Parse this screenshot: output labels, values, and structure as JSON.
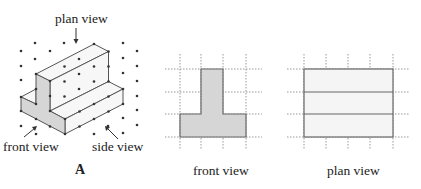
{
  "figure": {
    "isometric": {
      "caption": "A",
      "labels": {
        "plan_view": "plan view",
        "front_view": "front view",
        "side_view": "side view"
      },
      "lattice": {
        "origin": [
          65,
          134
        ],
        "u": [
          14.5,
          -7.5
        ],
        "v": [
          -14.5,
          -7.5
        ],
        "w": [
          0,
          -15
        ]
      },
      "colors": {
        "line": "#555555",
        "shade": "#d6d6d6",
        "face": "#f7f7f7",
        "dot": "#333333"
      }
    },
    "front_view": {
      "caption": "front view",
      "grid": {
        "xs": [
          180,
          201,
          223,
          246
        ],
        "ys": [
          69,
          92,
          114,
          137
        ]
      },
      "shape": "T",
      "fill": "#d6d6d6"
    },
    "plan_view": {
      "caption": "plan view",
      "grid": {
        "xs": [
          304,
          326,
          348,
          370,
          393
        ],
        "ys": [
          69,
          92,
          114,
          137
        ]
      },
      "shape": "rectangle-3-strips",
      "fill": "#f5f5f5"
    }
  }
}
